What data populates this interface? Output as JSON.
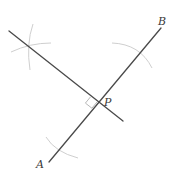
{
  "diagram": {
    "points": {
      "A": {
        "label": "A",
        "x": 49,
        "y": 162
      },
      "B": {
        "label": "B",
        "x": 161,
        "y": 28
      },
      "P": {
        "label": "P",
        "x": 97,
        "y": 102
      }
    },
    "labels": {
      "a": "A",
      "b": "B",
      "p": "P"
    },
    "colors": {
      "line": "#4a4a4a",
      "arc": "#cfcfcf",
      "right_angle": "#b8b8b8",
      "label": "#3a3a3a",
      "background": "#ffffff"
    }
  }
}
